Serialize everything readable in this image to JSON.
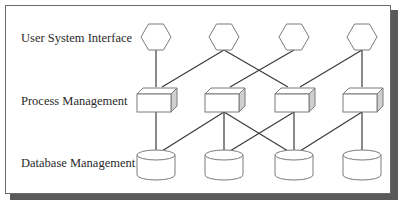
{
  "layers": [
    {
      "id": "user-system-interface",
      "label": "User System Interface",
      "shape": "hexagon",
      "y": 37
    },
    {
      "id": "process-management",
      "label": "Process Management",
      "shape": "cube",
      "y": 100
    },
    {
      "id": "database-management",
      "label": "Database Management",
      "shape": "cylinder",
      "y": 164
    }
  ],
  "columns_x": [
    156,
    224,
    294,
    362
  ],
  "colors": {
    "line": "#3a3a3a",
    "shape_stroke": "#7a7a7a",
    "shape_fill": "#ffffff",
    "cube_side": "#cfcfcf",
    "frame_border": "#6a6a6a",
    "frame_shadow": "#5a5a5a"
  },
  "connections": {
    "interface_to_process": [
      [
        1,
        1
      ],
      [
        2,
        1
      ],
      [
        2,
        3
      ],
      [
        3,
        2
      ],
      [
        4,
        3
      ],
      [
        4,
        4
      ]
    ],
    "process_to_database": [
      [
        1,
        1
      ],
      [
        2,
        1
      ],
      [
        2,
        2
      ],
      [
        2,
        3
      ],
      [
        3,
        2
      ],
      [
        3,
        3
      ],
      [
        4,
        3
      ],
      [
        4,
        4
      ]
    ]
  }
}
